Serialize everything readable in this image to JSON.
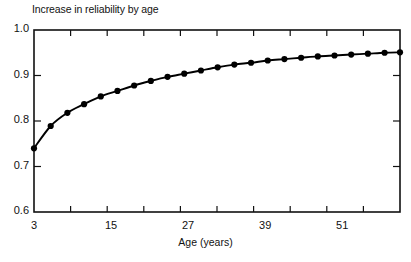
{
  "chart_data": {
    "type": "line",
    "title": "Increase in reliability by age",
    "xlabel": "Age (years)",
    "ylabel": "",
    "xlim": [
      3,
      60
    ],
    "ylim": [
      0.6,
      1.0
    ],
    "grid": false,
    "legend": "none",
    "marker": "filled-circle",
    "line_color": "#000000",
    "x_tick_labels": [
      "3",
      "15",
      "27",
      "39",
      "51"
    ],
    "x_tick_values": [
      3,
      15,
      27,
      39,
      51
    ],
    "y_tick_labels": [
      "1.0",
      "0.9",
      "0.8",
      "0.7",
      "0.6"
    ],
    "y_tick_values": [
      1.0,
      0.9,
      0.8,
      0.7,
      0.6
    ],
    "x": [
      3.0,
      5.6,
      8.2,
      10.8,
      13.4,
      16.0,
      18.6,
      21.2,
      23.8,
      26.4,
      29.0,
      31.6,
      34.2,
      36.8,
      39.4,
      42.0,
      44.6,
      47.2,
      49.8,
      52.4,
      55.0,
      57.6,
      60.0
    ],
    "values": [
      0.74,
      0.789,
      0.818,
      0.837,
      0.854,
      0.866,
      0.878,
      0.888,
      0.897,
      0.904,
      0.911,
      0.918,
      0.924,
      0.928,
      0.933,
      0.936,
      0.939,
      0.942,
      0.944,
      0.946,
      0.948,
      0.95,
      0.951
    ],
    "series": [
      {
        "name": "Reliability",
        "values": [
          0.74,
          0.789,
          0.818,
          0.837,
          0.854,
          0.866,
          0.878,
          0.888,
          0.897,
          0.904,
          0.911,
          0.918,
          0.924,
          0.928,
          0.933,
          0.936,
          0.939,
          0.942,
          0.944,
          0.946,
          0.948,
          0.95,
          0.951
        ]
      }
    ]
  },
  "axes": {
    "y_ticks": [
      {
        "label": "1.0",
        "value": 1.0
      },
      {
        "label": "0.9",
        "value": 0.9
      },
      {
        "label": "0.8",
        "value": 0.8
      },
      {
        "label": "0.7",
        "value": 0.7
      },
      {
        "label": "0.6",
        "value": 0.6
      }
    ],
    "x_ticks": [
      {
        "label": "3",
        "value": 3
      },
      {
        "label": "15",
        "value": 15
      },
      {
        "label": "27",
        "value": 27
      },
      {
        "label": "39",
        "value": 39
      },
      {
        "label": "51",
        "value": 51
      }
    ]
  },
  "colors": {
    "ink": "#000000",
    "background": "#ffffff"
  }
}
